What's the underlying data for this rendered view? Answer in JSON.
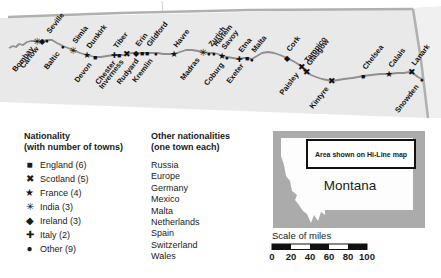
{
  "map": {
    "strip_bg": "#e9e9e9",
    "outer_bg": "#f0f0f0",
    "border_color": "#b0b0b0",
    "route_color": "#8f8f8f",
    "marker_color": "#111111",
    "route": [
      [
        9,
        48
      ],
      [
        13,
        46
      ],
      [
        16,
        47
      ],
      [
        19,
        44
      ],
      [
        23,
        45
      ],
      [
        27,
        42
      ],
      [
        31,
        41
      ],
      [
        37,
        41
      ],
      [
        42,
        41
      ],
      [
        47,
        40
      ],
      [
        52,
        40
      ],
      [
        57,
        43
      ],
      [
        63,
        46
      ],
      [
        68,
        48
      ],
      [
        73,
        50
      ],
      [
        80,
        53
      ],
      [
        87,
        55
      ],
      [
        95,
        57
      ],
      [
        101,
        57
      ],
      [
        107,
        56
      ],
      [
        114,
        55
      ],
      [
        119,
        55
      ],
      [
        123,
        55
      ],
      [
        127,
        54
      ],
      [
        132,
        53
      ],
      [
        136,
        53
      ],
      [
        143,
        53
      ],
      [
        147,
        53
      ],
      [
        152,
        53
      ],
      [
        158,
        53
      ],
      [
        163,
        54
      ],
      [
        168,
        54
      ],
      [
        174,
        54
      ],
      [
        180,
        52
      ],
      [
        186,
        50
      ],
      [
        192,
        50
      ],
      [
        198,
        51
      ],
      [
        203,
        52
      ],
      [
        209,
        53
      ],
      [
        214,
        53
      ],
      [
        218,
        54
      ],
      [
        223,
        56
      ],
      [
        227,
        57
      ],
      [
        233,
        58
      ],
      [
        239,
        59
      ],
      [
        243,
        58
      ],
      [
        247,
        58
      ],
      [
        252,
        59
      ],
      [
        257,
        56
      ],
      [
        262,
        53
      ],
      [
        268,
        52
      ],
      [
        274,
        53
      ],
      [
        280,
        55
      ],
      [
        287,
        58
      ],
      [
        293,
        61
      ],
      [
        298,
        64
      ],
      [
        302,
        67
      ],
      [
        305,
        69
      ],
      [
        307,
        72
      ],
      [
        311,
        75
      ],
      [
        316,
        77
      ],
      [
        322,
        79
      ],
      [
        327,
        80
      ],
      [
        332,
        81
      ],
      [
        338,
        80
      ],
      [
        344,
        79
      ],
      [
        352,
        78
      ],
      [
        358,
        77
      ],
      [
        363,
        76
      ],
      [
        371,
        75
      ],
      [
        380,
        74
      ],
      [
        389,
        74
      ],
      [
        397,
        73
      ],
      [
        404,
        73
      ],
      [
        409,
        72
      ],
      [
        414,
        74
      ],
      [
        418,
        77
      ],
      [
        422,
        79
      ]
    ],
    "towns": [
      {
        "name": "Bombay",
        "x": 37,
        "y": 41,
        "glyph": "✳",
        "nationality": "India",
        "side": "below"
      },
      {
        "name": "Carlow",
        "x": 42,
        "y": 41,
        "glyph": "◆",
        "nationality": "Ireland",
        "side": "below"
      },
      {
        "name": "Seville",
        "x": 47,
        "y": 40,
        "glyph": "●",
        "nationality": "Other",
        "side": "above"
      },
      {
        "name": "Baltic",
        "x": 63,
        "y": 46,
        "glyph": "●",
        "nationality": "Other",
        "side": "below"
      },
      {
        "name": "Simla",
        "x": 73,
        "y": 50,
        "glyph": "✳",
        "nationality": "India",
        "side": "above"
      },
      {
        "name": "Dunkirk",
        "x": 87,
        "y": 55,
        "glyph": "★",
        "nationality": "France",
        "side": "above"
      },
      {
        "name": "Devon",
        "x": 95,
        "y": 57,
        "glyph": "■",
        "nationality": "England",
        "side": "below"
      },
      {
        "name": "Tiber",
        "x": 114,
        "y": 55,
        "glyph": "✚",
        "nationality": "Italy",
        "side": "above"
      },
      {
        "name": "Chester",
        "x": 119,
        "y": 55,
        "glyph": "■",
        "nationality": "England",
        "side": "below"
      },
      {
        "name": "Inverness",
        "x": 127,
        "y": 54,
        "glyph": "✖",
        "nationality": "Scotland",
        "side": "below"
      },
      {
        "name": "Erin",
        "x": 136,
        "y": 53,
        "glyph": "◆",
        "nationality": "Ireland",
        "side": "above"
      },
      {
        "name": "Rudyard",
        "x": 142,
        "y": 53,
        "glyph": "■",
        "nationality": "England",
        "side": "below"
      },
      {
        "name": "Gildford",
        "x": 147,
        "y": 53,
        "glyph": "■",
        "nationality": "England",
        "side": "above"
      },
      {
        "name": "Kremlin",
        "x": 156,
        "y": 53,
        "glyph": "●",
        "nationality": "Other",
        "side": "below"
      },
      {
        "name": "Havre",
        "x": 174,
        "y": 54,
        "glyph": "★",
        "nationality": "France",
        "side": "above"
      },
      {
        "name": "Madras",
        "x": 203,
        "y": 52,
        "glyph": "✳",
        "nationality": "India",
        "side": "below"
      },
      {
        "name": "Zurich",
        "x": 209,
        "y": 53,
        "glyph": "●",
        "nationality": "Other",
        "side": "above"
      },
      {
        "name": "Harlem",
        "x": 214,
        "y": 53,
        "glyph": "●",
        "nationality": "Other",
        "side": "above"
      },
      {
        "name": "Savoy",
        "x": 222,
        "y": 56,
        "glyph": "★",
        "nationality": "France",
        "side": "above"
      },
      {
        "name": "Coburg",
        "x": 227,
        "y": 57,
        "glyph": "●",
        "nationality": "Other",
        "side": "below"
      },
      {
        "name": "Etna",
        "x": 239,
        "y": 59,
        "glyph": "✚",
        "nationality": "Italy",
        "side": "above"
      },
      {
        "name": "Exeter",
        "x": 247,
        "y": 58,
        "glyph": "■",
        "nationality": "England",
        "side": "below"
      },
      {
        "name": "Malta",
        "x": 252,
        "y": 59,
        "glyph": "●",
        "nationality": "Other",
        "side": "above"
      },
      {
        "name": "Cork",
        "x": 287,
        "y": 58,
        "glyph": "◆",
        "nationality": "Ireland",
        "side": "above"
      },
      {
        "name": "Paisley",
        "x": 302,
        "y": 67,
        "glyph": "✖",
        "nationality": "Scotland",
        "side": "below"
      },
      {
        "name": "Tampico",
        "x": 305,
        "y": 69,
        "glyph": "●",
        "nationality": "Other",
        "side": "above"
      },
      {
        "name": "Glasgow",
        "x": 307,
        "y": 72,
        "glyph": "✖",
        "nationality": "Scotland",
        "side": "above"
      },
      {
        "name": "Kintyre",
        "x": 332,
        "y": 81,
        "glyph": "✖",
        "nationality": "Scotland",
        "side": "below"
      },
      {
        "name": "Chelsea",
        "x": 363,
        "y": 76,
        "glyph": "■",
        "nationality": "England",
        "side": "above"
      },
      {
        "name": "Calais",
        "x": 389,
        "y": 74,
        "glyph": "★",
        "nationality": "France",
        "side": "above"
      },
      {
        "name": "Lanark",
        "x": 412,
        "y": 72,
        "glyph": "✖",
        "nationality": "Scotland",
        "side": "above"
      },
      {
        "name": "Snowden",
        "x": 422,
        "y": 79,
        "glyph": "●",
        "nationality": "Other",
        "side": "below"
      }
    ]
  },
  "legend": {
    "title_line1": "Nationality",
    "title_line2": "(with number of towns)",
    "items": [
      {
        "glyph": "■",
        "icon_name": "square-icon",
        "label": "England (6)"
      },
      {
        "glyph": "✖",
        "icon_name": "cross-icon",
        "label": "Scotland (5)"
      },
      {
        "glyph": "★",
        "icon_name": "star-icon",
        "label": "France (4)"
      },
      {
        "glyph": "✳",
        "icon_name": "asterisk-icon",
        "label": "India (3)"
      },
      {
        "glyph": "◆",
        "icon_name": "diamond-icon",
        "label": "Ireland (3)"
      },
      {
        "glyph": "✚",
        "icon_name": "plus-icon",
        "label": "Italy (2)"
      },
      {
        "glyph": "●",
        "icon_name": "circle-icon",
        "label": "Other (9)"
      }
    ]
  },
  "other_nationalities": {
    "title_line1": "Other nationalities",
    "title_line2": "(one town each)",
    "items": [
      "Russia",
      "Europe",
      "Germany",
      "Mexico",
      "Malta",
      "Netherlands",
      "Spain",
      "Switzerland",
      "Wales"
    ]
  },
  "inset": {
    "bg_color": "#ababab",
    "state_fill": "#fdfdfd",
    "box_label": "Area shown on Hi-Line map",
    "state_label": "Montana"
  },
  "scale": {
    "label": "Scale of miles",
    "tick_labels": [
      "0",
      "20",
      "40",
      "60",
      "80",
      "100"
    ],
    "bar_color": "#111111"
  }
}
